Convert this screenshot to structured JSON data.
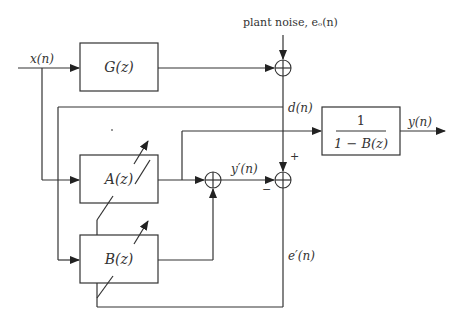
{
  "diagram": {
    "type": "block-diagram",
    "blocks": {
      "G": {
        "label": "G(z)"
      },
      "A": {
        "label": "A(z)"
      },
      "B": {
        "label": "B(z)"
      },
      "inverse": {
        "numerator": "1",
        "denominator": "1 − B(z)"
      }
    },
    "signals": {
      "input": "x(n)",
      "noise": "plant noise, eₒ(n)",
      "desired": "d(n)",
      "output": "y(n)",
      "estimate": "y′(n)",
      "error": "e′(n)"
    },
    "signs": {
      "plus": "+",
      "minus": "−"
    },
    "summing_junctions": [
      "plant-noise-sum",
      "adaptive-sum",
      "error-sum"
    ],
    "colors": {
      "stroke": "#333333",
      "background": "#ffffff"
    }
  }
}
